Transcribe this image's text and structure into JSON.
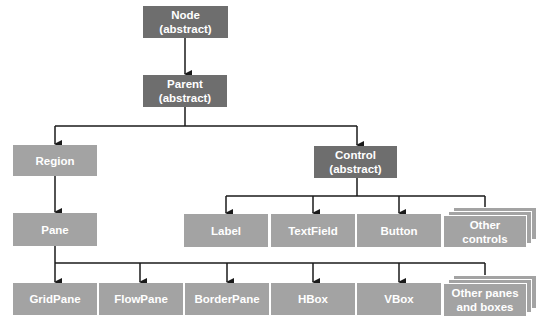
{
  "diagram": {
    "colors": {
      "abstract_box": "#6e6e6e",
      "concrete_box": "#a3a3a3",
      "text": "#ffffff",
      "line": "#1a1a1a"
    },
    "nodes": {
      "node": {
        "line1": "Node",
        "line2": "(abstract)"
      },
      "parent": {
        "line1": "Parent",
        "line2": "(abstract)"
      },
      "region": {
        "label": "Region"
      },
      "control": {
        "line1": "Control",
        "line2": "(abstract)"
      },
      "pane": {
        "label": "Pane"
      },
      "controls": [
        {
          "label": "Label"
        },
        {
          "label": "TextField"
        },
        {
          "label": "Button"
        },
        {
          "line1": "Other",
          "line2": "controls"
        }
      ],
      "panes": [
        {
          "label": "GridPane"
        },
        {
          "label": "FlowPane"
        },
        {
          "label": "BorderPane"
        },
        {
          "label": "HBox"
        },
        {
          "label": "VBox"
        },
        {
          "line1": "Other panes",
          "line2": "and boxes"
        }
      ]
    },
    "edges": [
      [
        "Node",
        "Parent"
      ],
      [
        "Parent",
        "Region"
      ],
      [
        "Parent",
        "Control"
      ],
      [
        "Region",
        "Pane"
      ],
      [
        "Control",
        "Label"
      ],
      [
        "Control",
        "TextField"
      ],
      [
        "Control",
        "Button"
      ],
      [
        "Control",
        "Other controls"
      ],
      [
        "Pane",
        "GridPane"
      ],
      [
        "Pane",
        "FlowPane"
      ],
      [
        "Pane",
        "BorderPane"
      ],
      [
        "Pane",
        "HBox"
      ],
      [
        "Pane",
        "VBox"
      ],
      [
        "Pane",
        "Other panes and boxes"
      ]
    ]
  }
}
